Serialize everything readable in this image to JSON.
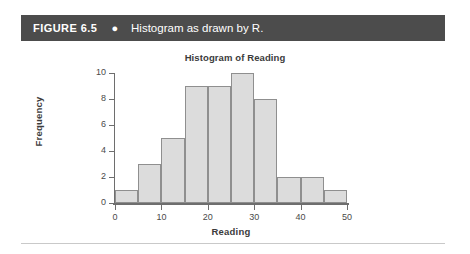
{
  "figure": {
    "number": "FIGURE 6.5",
    "bullet": "●",
    "caption": "Histogram as drawn by R.",
    "banner_color": "#4c4c4c",
    "banner_text_color": "#ffffff"
  },
  "chart_data": {
    "type": "bar",
    "title": "Histogram of Reading",
    "xlabel": "Reading",
    "ylabel": "Frequency",
    "xlim": [
      0,
      50
    ],
    "ylim": [
      0,
      10
    ],
    "xticks": [
      0,
      10,
      20,
      30,
      40,
      50
    ],
    "yticks": [
      0,
      2,
      4,
      6,
      8,
      10
    ],
    "xtick_labels": [
      "0",
      "10",
      "20",
      "30",
      "40",
      "50"
    ],
    "ytick_labels": [
      "0",
      "2",
      "4",
      "6",
      "8",
      "10"
    ],
    "grid": false,
    "legend": false,
    "bin_width": 5,
    "bin_edges": [
      0,
      5,
      10,
      15,
      20,
      25,
      30,
      35,
      40,
      45,
      50
    ],
    "categories": [
      "0-5",
      "5-10",
      "10-15",
      "15-20",
      "20-25",
      "25-30",
      "30-35",
      "35-40",
      "40-45",
      "45-50"
    ],
    "values": [
      1,
      3,
      5,
      9,
      9,
      10,
      8,
      2,
      2,
      1
    ],
    "bar_fill_color": "#dcdcdc",
    "bar_border_color": "#8f8f8f",
    "axis_color": "#6e6e6e"
  },
  "divider": {
    "color": "#c9c9c9"
  }
}
